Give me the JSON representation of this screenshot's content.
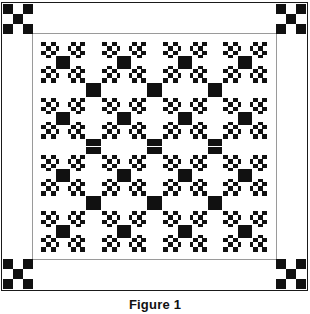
{
  "figure": {
    "caption": "Figure 1",
    "colors": {
      "ink": "#111111",
      "cloth": "#ffffff",
      "keyline": "#9a9a9a"
    },
    "layout": {
      "grid_rows": 4,
      "grid_cols": 4,
      "block_count": 16,
      "block_unit_grid": 9,
      "sashing": "white",
      "cornerstone": "black"
    },
    "border": {
      "corner_patch": "three-by-three checkerboard",
      "corner_patch_cells": [
        "black",
        "white",
        "black",
        "white",
        "black",
        "white",
        "black",
        "white",
        "black"
      ],
      "stripe_color": "#111111",
      "outer_keyline_color": "#1a1a1a"
    },
    "block": {
      "name": "double-irish-chain-variation",
      "rows": [
        "111111111",
        "101010101",
        "111111111",
        "100000001",
        "101000101",
        "100000001",
        "111111111",
        "101010101",
        "111111111"
      ],
      "legend": {
        "1": "ink",
        "0": "cloth"
      }
    }
  },
  "blocks": [
    {
      "id": "block-r1c1"
    },
    {
      "id": "block-r1c2"
    },
    {
      "id": "block-r1c3"
    },
    {
      "id": "block-r1c4"
    },
    {
      "id": "block-r2c1"
    },
    {
      "id": "block-r2c2"
    },
    {
      "id": "block-r2c3"
    },
    {
      "id": "block-r2c4"
    },
    {
      "id": "block-r3c1"
    },
    {
      "id": "block-r3c2"
    },
    {
      "id": "block-r3c3"
    },
    {
      "id": "block-r3c4"
    },
    {
      "id": "block-r4c1"
    },
    {
      "id": "block-r4c2"
    },
    {
      "id": "block-r4c3"
    },
    {
      "id": "block-r4c4"
    }
  ]
}
